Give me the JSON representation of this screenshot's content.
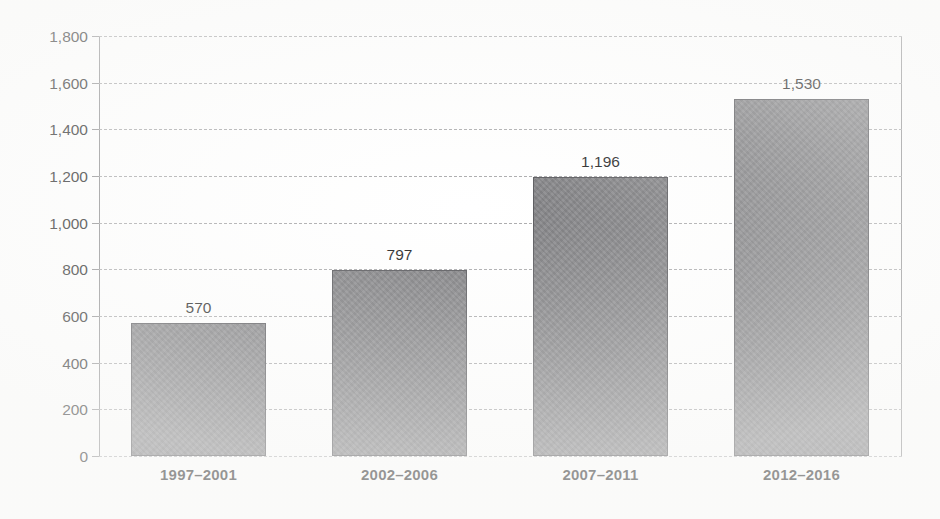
{
  "chart_data": {
    "type": "bar",
    "title": "",
    "subtitle": "",
    "xlabel": "",
    "ylabel": "",
    "categories": [
      "1997–2001",
      "2002–2006",
      "2007–2011",
      "2012–2016"
    ],
    "values": [
      570,
      797,
      1196,
      1530
    ],
    "value_labels": [
      "570",
      "797",
      "1,196",
      "1,530"
    ],
    "ylim": [
      0,
      1800
    ],
    "ytick_values": [
      0,
      200,
      400,
      600,
      800,
      1000,
      1200,
      1400,
      1600,
      1800
    ],
    "ytick_labels": [
      "0",
      "200",
      "400",
      "600",
      "800",
      "1,000",
      "1,200",
      "1,400",
      "1,600",
      "1,800"
    ],
    "grid": "horizontal-dashed",
    "legend": "none",
    "legend_position": "none",
    "series": [
      {
        "name": "",
        "values": [
          570,
          797,
          1196,
          1530
        ],
        "color": "#808083"
      }
    ],
    "colors": {
      "bar_fill": "#808083",
      "bar_border": "#56565a",
      "gridline": "#a9a9ab",
      "axis_line": "#8e8e90",
      "text": "#1f1f1f",
      "background": "#ffffff"
    }
  }
}
